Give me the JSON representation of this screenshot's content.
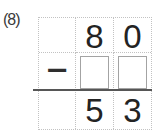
{
  "problem_label": "(8)",
  "grid": {
    "top_row": {
      "hundreds": "",
      "tens": "8",
      "ones": "0"
    },
    "middle_row": {
      "operator": "−"
    },
    "result_row": {
      "hundreds": "",
      "tens": "5",
      "ones": "3"
    }
  },
  "answer_boxes": {
    "count": 2,
    "state": "empty"
  },
  "colors": {
    "background": "#ffffff",
    "digit": "#232323",
    "grid_dotted_line": "#c2c2c2",
    "rule_line": "#565656",
    "answer_box_border": "#a3a3a3"
  }
}
